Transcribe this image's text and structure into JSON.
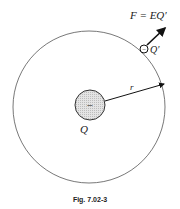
{
  "figure": {
    "force_label": "F = EQ′",
    "test_charge_label": "Q′",
    "test_charge_sign": "−",
    "source_charge_label": "Q",
    "source_charge_sign": "−",
    "radius_label": "r",
    "caption": "Fig. 7.02-3"
  }
}
